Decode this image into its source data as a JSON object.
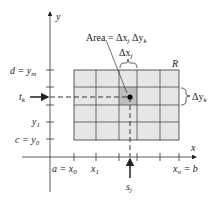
{
  "figure": {
    "region_label": "R",
    "area_label": "Area = Δxⱼ Δyₖ",
    "area_prefix": "Area = ",
    "area_dx": "Δx",
    "area_dx_sub": "j",
    "area_dy": "Δy",
    "area_dy_sub": "k",
    "dx_label": "Δx",
    "dx_sub": "j",
    "dy_label": "Δy",
    "dy_sub": "k",
    "axes": {
      "x_label": "x",
      "y_label": "y"
    },
    "y_ticks": [
      {
        "label": "d = y",
        "sub": "m"
      },
      {
        "label": "y",
        "sub": "1"
      },
      {
        "label": "c = y",
        "sub": "0"
      }
    ],
    "x_ticks": [
      {
        "label": "a = x",
        "sub": "0"
      },
      {
        "label": "x",
        "sub": "1"
      },
      {
        "label": "x",
        "sub": "n",
        "suffix": " = b"
      }
    ],
    "t_label": "t",
    "t_sub": "k",
    "s_label": "s",
    "s_sub": "j",
    "colors": {
      "grid_fill": "#e6e6e6",
      "highlight_fill": "#bdbdbd",
      "line": "#333333"
    }
  }
}
